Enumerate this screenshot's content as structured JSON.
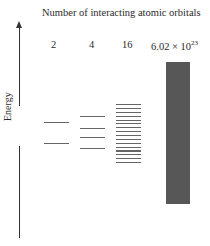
{
  "title": "Number of interacting atomic orbitals",
  "axis": {
    "label": "Energy",
    "direction": "up",
    "arrow_icon": "arrow-up-icon"
  },
  "columns": [
    {
      "count": "2",
      "levels": 2,
      "level_y": [
        122,
        143
      ]
    },
    {
      "count": "4",
      "levels": 4,
      "level_y": [
        116,
        128,
        136,
        148
      ]
    },
    {
      "count": "16",
      "levels": 16,
      "level_y_start": 104,
      "level_y_end": 162
    },
    {
      "count_base": "6.02 × 10",
      "count_exp": "23",
      "levels": "continuous band"
    }
  ],
  "colors": {
    "level_line": "#666666",
    "band_fill": "#575757",
    "axis": "#333333"
  }
}
